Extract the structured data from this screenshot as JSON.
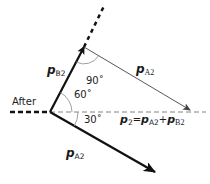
{
  "diagram": {
    "state_label": "After",
    "vectors": {
      "pB2": {
        "symbol": "p",
        "subscript": "B2"
      },
      "pA2_translated": {
        "symbol": "p",
        "subscript": "A2"
      },
      "pA2": {
        "symbol": "p",
        "subscript": "A2"
      }
    },
    "equation": {
      "lhs_symbol": "p",
      "lhs_subscript": "2",
      "equals": "=",
      "term1_symbol": "p",
      "term1_subscript": "A2",
      "plus": "+",
      "term2_symbol": "p",
      "term2_subscript": "B2"
    },
    "angles": {
      "right_angle": "90˚",
      "upper_angle": "60˚",
      "lower_angle": "30˚"
    },
    "colors": {
      "heavy_line": "#111111",
      "thin_line": "#555555",
      "arc": "#888888",
      "dashed_axis": "#666666"
    }
  }
}
